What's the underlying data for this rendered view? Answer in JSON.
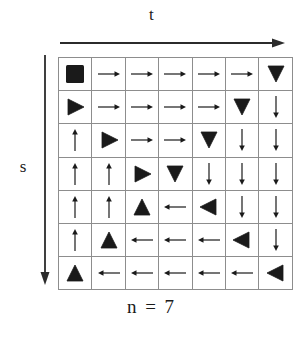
{
  "figure": {
    "caption": "n = 7",
    "x_axis": {
      "label": "t",
      "direction": "right",
      "icon": "right-arrow-icon"
    },
    "y_axis": {
      "label": "s",
      "direction": "down",
      "icon": "down-arrow-icon"
    },
    "grid": {
      "rows": 7,
      "cols": 7,
      "border_color": "#8d8d8d",
      "glyph_color": "#1a1a1a",
      "background": "#ffffff"
    }
  },
  "chart_data": {
    "type": "heatmap",
    "title": "n = 7",
    "xlabel": "t",
    "ylabel": "s",
    "grid": true,
    "legend": "none",
    "rows": 7,
    "cols": 7,
    "cell_kinds": {
      "block": "filled square (start/block marker)",
      "thin-right": "thin line arrow pointing right",
      "thin-left": "thin line arrow pointing left",
      "thin-up": "thin line arrow pointing up",
      "thin-down": "thin line arrow pointing down",
      "bold-right": "solid filled triangle pointing right",
      "bold-left": "solid filled triangle pointing left",
      "bold-up": "solid filled triangle pointing up",
      "bold-down": "solid filled triangle pointing down"
    },
    "cells": [
      [
        "block",
        "thin-right",
        "thin-right",
        "thin-right",
        "thin-right",
        "thin-right",
        "bold-down"
      ],
      [
        "bold-right",
        "thin-right",
        "thin-right",
        "thin-right",
        "thin-right",
        "bold-down",
        "thin-down"
      ],
      [
        "thin-up",
        "bold-right",
        "thin-right",
        "thin-right",
        "bold-down",
        "thin-down",
        "thin-down"
      ],
      [
        "thin-up",
        "thin-up",
        "bold-right",
        "bold-down",
        "thin-down",
        "thin-down",
        "thin-down"
      ],
      [
        "thin-up",
        "thin-up",
        "bold-up",
        "thin-left",
        "bold-left",
        "thin-down",
        "thin-down"
      ],
      [
        "thin-up",
        "bold-up",
        "thin-left",
        "thin-left",
        "thin-left",
        "bold-left",
        "thin-down"
      ],
      [
        "bold-up",
        "thin-left",
        "thin-left",
        "thin-left",
        "thin-left",
        "thin-left",
        "bold-left"
      ]
    ]
  }
}
